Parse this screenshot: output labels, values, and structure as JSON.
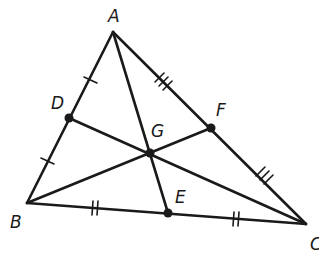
{
  "diagram": {
    "stroke_color": "#1a1a1a",
    "background": "#ffffff",
    "vertices": {
      "A": {
        "label": "A",
        "x": 113,
        "y": 32,
        "lx": 108,
        "ly": 22
      },
      "B": {
        "label": "B",
        "x": 27,
        "y": 203,
        "lx": 10,
        "ly": 228
      },
      "C": {
        "label": "C",
        "x": 306,
        "y": 224,
        "lx": 310,
        "ly": 250
      }
    },
    "points": {
      "D": {
        "label": "D",
        "x": 69,
        "y": 118,
        "lx": 51,
        "ly": 109
      },
      "E": {
        "label": "E",
        "x": 168,
        "y": 213,
        "lx": 175,
        "ly": 203
      },
      "F": {
        "label": "F",
        "x": 211,
        "y": 128,
        "lx": 216,
        "ly": 116
      },
      "G": {
        "label": "G",
        "x": 150,
        "y": 153,
        "lx": 151,
        "ly": 137
      }
    },
    "segments": [
      "AB",
      "BC",
      "CA",
      "AE",
      "BF",
      "CD"
    ],
    "tick_marks": [
      {
        "segment": "AD",
        "count": 1
      },
      {
        "segment": "DB",
        "count": 1
      },
      {
        "segment": "BE",
        "count": 2
      },
      {
        "segment": "EC",
        "count": 2
      },
      {
        "segment": "AF",
        "count": 3
      },
      {
        "segment": "FC",
        "count": 3
      }
    ]
  }
}
